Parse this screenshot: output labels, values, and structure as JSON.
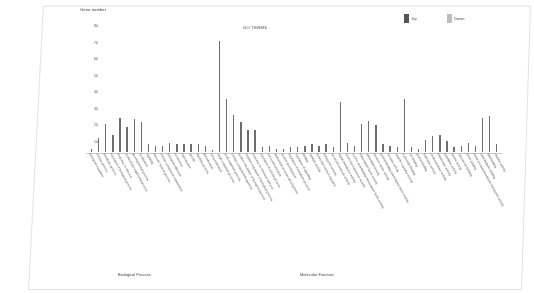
{
  "chart_data": {
    "type": "bar",
    "title": "GO TERMS",
    "ylabel": "Gene number",
    "xlabel": "",
    "ylim": [
      0,
      80
    ],
    "yticks": [
      80,
      70,
      60,
      50,
      40,
      30,
      20,
      10
    ],
    "grid": false,
    "legend_position": "top-right",
    "legend": [
      {
        "name": "Up",
        "color": "#555555"
      },
      {
        "name": "Down",
        "color": "#bdbdbd"
      }
    ],
    "groups": [
      {
        "name": "Biological Process",
        "start": 0,
        "end": 30
      },
      {
        "name": "Molecular Function",
        "start": 30,
        "end": 58
      }
    ],
    "bar_color": "#6e6e6e",
    "categories": [
      "biological regulation",
      "cellular process",
      "metabolic process",
      "regulation of biological process",
      "response to stimulus",
      "multicellular organismal process",
      "developmental process",
      "localization",
      "signaling",
      "immune system process",
      "cellular component organization",
      "biological adhesion",
      "locomotion",
      "reproduction",
      "growth",
      "rhythmic process",
      "detoxification",
      "cell proliferation",
      "single-organism process",
      "multi-organism process",
      "cellular component biogenesis",
      "positive regulation of biological process",
      "negative regulation of biological process",
      "response to chemical stimulus",
      "regulation of cellular process",
      "cell communication",
      "anatomical structure development",
      "system development",
      "regulation of metabolic process",
      "regulation of signaling",
      "binding",
      "catalytic activity",
      "molecular function regulator",
      "transporter activity",
      "structural molecule activity",
      "signal transducer activity",
      "molecular transducer activity",
      "nucleic acid binding transcription factor activity",
      "transcription factor activity",
      "antioxidant activity",
      "electron carrier activity",
      "protein binding transcription factor activity",
      "receptor activity",
      "enzyme regulator activity",
      "nucleotide binding",
      "ion binding",
      "protein binding",
      "hydrolase activity",
      "oxidoreductase activity",
      "transferase activity",
      "peptidase activity",
      "kinase activity",
      "calcium ion binding",
      "heme binding",
      "metal ion transmembrane transporter activity",
      "carbohydrate binding",
      "lipid binding",
      "channel activity"
    ],
    "values": [
      2,
      9,
      18,
      11,
      22,
      16,
      21,
      19,
      5,
      4,
      4,
      6,
      5,
      5,
      5,
      5,
      4,
      1,
      71,
      34,
      24,
      19,
      14,
      14,
      3,
      4,
      2,
      2,
      3,
      3,
      4,
      5,
      4,
      5,
      3,
      32,
      6,
      4,
      18,
      20,
      17,
      5,
      4,
      3,
      34,
      3,
      2,
      8,
      10,
      11,
      7,
      3,
      4,
      6,
      4,
      22,
      23,
      5
    ]
  }
}
